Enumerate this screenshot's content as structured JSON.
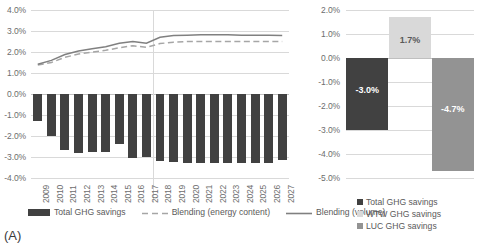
{
  "panel_a": {
    "tag": "(A)",
    "legend": [
      {
        "label": "Total GHG savings",
        "marker": "bar",
        "color": "#414141"
      },
      {
        "label": "Blending (energy content)",
        "marker": "dashed-line",
        "color": "#a6a6a6"
      },
      {
        "label": "Blending (volume)",
        "marker": "solid-line",
        "color": "#808080"
      }
    ]
  },
  "panel_b": {
    "tag": "(B)",
    "legend": [
      {
        "label": "Total GHG savings",
        "marker": "square",
        "color": "#414141"
      },
      {
        "label": "WTW GHG savings",
        "marker": "square",
        "color": "#d9d9d9"
      },
      {
        "label": "LUC GHG savings",
        "marker": "square",
        "color": "#939393"
      }
    ]
  },
  "chart_data": [
    {
      "id": "panel-a",
      "type": "bar",
      "title": "",
      "xlabel": "",
      "ylabel": "",
      "ylim": [
        -4.0,
        4.0
      ],
      "ytick_labels": [
        "4.0%",
        "3.0%",
        "2.0%",
        "1.0%",
        "0.0%",
        "-1.0%",
        "-2.0%",
        "-3.0%",
        "-4.0%"
      ],
      "ytick_values": [
        4.0,
        3.0,
        2.0,
        1.0,
        0.0,
        -1.0,
        -2.0,
        -3.0,
        -4.0
      ],
      "grid": true,
      "legend_position": "bottom",
      "categories": [
        "2009",
        "2010",
        "2011",
        "2012",
        "2013",
        "2014",
        "2015",
        "2016",
        "2017",
        "2018",
        "2019",
        "2020",
        "2021",
        "2022",
        "2023",
        "2024",
        "2025",
        "2026",
        "2027"
      ],
      "series": [
        {
          "name": "Total GHG savings",
          "chart_type": "bar",
          "color": "#414141",
          "values": [
            -1.3,
            -2.0,
            -2.65,
            -2.8,
            -2.75,
            -2.75,
            -2.4,
            -3.05,
            -3.0,
            -3.2,
            -3.25,
            -3.3,
            -3.3,
            -3.3,
            -3.3,
            -3.3,
            -3.3,
            -3.3,
            -3.15
          ]
        },
        {
          "name": "Blending (energy content)",
          "chart_type": "line",
          "style": "dashed",
          "color": "#a6a6a6",
          "values": [
            1.38,
            1.5,
            1.75,
            1.9,
            2.0,
            2.08,
            2.2,
            2.3,
            2.22,
            2.4,
            2.47,
            2.5,
            2.5,
            2.5,
            2.5,
            2.5,
            2.5,
            2.5,
            2.5
          ]
        },
        {
          "name": "Blending (volume)",
          "chart_type": "line",
          "style": "solid",
          "color": "#808080",
          "values": [
            1.42,
            1.6,
            1.88,
            2.05,
            2.15,
            2.25,
            2.42,
            2.5,
            2.42,
            2.7,
            2.78,
            2.8,
            2.82,
            2.82,
            2.82,
            2.8,
            2.8,
            2.8,
            2.78
          ]
        }
      ]
    },
    {
      "id": "panel-b",
      "type": "bar",
      "title": "",
      "xlabel": "",
      "ylabel": "",
      "ylim": [
        -5.0,
        2.0
      ],
      "ytick_labels": [
        "2.0%",
        "1.0%",
        "0.0%",
        "-1.0%",
        "-2.0%",
        "-3.0%",
        "-4.0%",
        "-5.0%"
      ],
      "ytick_values": [
        2.0,
        1.0,
        0.0,
        -1.0,
        -2.0,
        -3.0,
        -4.0,
        -5.0
      ],
      "grid": true,
      "legend_position": "bottom",
      "categories": [
        "Total GHG savings",
        "WTW GHG savings",
        "LUC GHG savings"
      ],
      "values": [
        -3.0,
        1.7,
        -4.7
      ],
      "colors": [
        "#414141",
        "#d9d9d9",
        "#939393"
      ],
      "data_labels": [
        "-3.0%",
        "1.7%",
        "-4.7%"
      ],
      "data_label_colors": [
        "#ffffff",
        "#595959",
        "#ffffff"
      ]
    }
  ]
}
